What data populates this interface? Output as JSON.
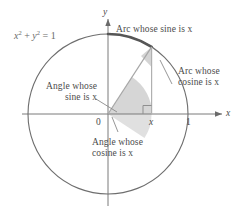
{
  "figure": {
    "type": "unit-circle-diagram",
    "equation": {
      "base1": "x",
      "exp1": "2",
      "plus": " + ",
      "base2": "y",
      "exp2": "2",
      "equals": " = 1"
    },
    "axis_labels": {
      "x": "x",
      "y": "y"
    },
    "tick_labels": {
      "origin": "0",
      "one": "1",
      "foot": "x"
    },
    "annotations": {
      "arc_sine": "Arc whose sine is x",
      "arc_cosine_line1": "Arc whose",
      "arc_cosine_line2": "cosine is x",
      "angle_sine_line1": "Angle whose",
      "angle_sine_line2": "sine is x",
      "angle_cosine_line1": "Angle whose",
      "angle_cosine_line2": "cosine is x"
    },
    "colors": {
      "circle_stroke": "#6e6e6e",
      "thick_arc_stroke": "#5a5a5a",
      "axis_stroke": "#7a7a7a",
      "radius_stroke": "#9a9a9a",
      "sector_fill": "#c9c9c9",
      "text": "#4b4b4b",
      "equation_text": "#6a6a6a",
      "leader_stroke": "#8a8a8a",
      "background": "#ffffff"
    },
    "geometry": {
      "center_x": 108,
      "center_y": 114,
      "radius": 80,
      "point_angle_deg": 57,
      "foot_x": 152
    }
  }
}
